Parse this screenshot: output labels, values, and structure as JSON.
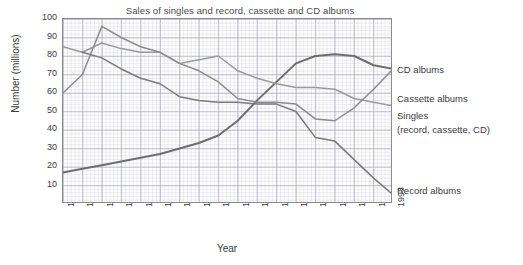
{
  "chart": {
    "title": "Sales of singles and record, cassette and CD albums",
    "xlabel": "Year",
    "ylabel": "Number (millions)"
  },
  "axis": {
    "y_ticks": [
      "100",
      "90",
      "80",
      "70",
      "60",
      "50",
      "40",
      "30",
      "20",
      "10"
    ],
    "x_ticks": [
      "1976",
      "1977",
      "1978",
      "1979",
      "1980",
      "1981",
      "1982",
      "1983",
      "1984",
      "1985",
      "1986",
      "1987",
      "1988",
      "1989",
      "1990",
      "1991",
      "1992",
      "1993"
    ]
  },
  "annotations": {
    "cd": "CD albums",
    "cassette": "Cassette albums",
    "singles": "Singles",
    "singles_sub": "(record, cassette, CD)",
    "record": "Record albums"
  },
  "chart_data": {
    "type": "line",
    "title": "Sales of singles and record, cassette and CD albums",
    "xlabel": "Year",
    "ylabel": "Number (millions)",
    "xlim": [
      1976,
      1993
    ],
    "ylim": [
      0,
      100
    ],
    "ytick_step": 10,
    "grid": true,
    "legend_position": "right-of-axes (inline series labels)",
    "categories": [
      1976,
      1977,
      1978,
      1979,
      1980,
      1981,
      1982,
      1983,
      1984,
      1985,
      1986,
      1987,
      1988,
      1989,
      1990,
      1991,
      1992,
      1993
    ],
    "series": [
      {
        "name": "CD albums",
        "color": "#6e6e6e",
        "x": [
          1976,
          1977,
          1978,
          1979,
          1980,
          1981,
          1982,
          1983,
          1984,
          1985,
          1986,
          1987,
          1988,
          1989,
          1990,
          1991,
          1992,
          1993
        ],
        "values": [
          17,
          19,
          21,
          23,
          25,
          27,
          30,
          33,
          37,
          45,
          56,
          66,
          76,
          80,
          81,
          80,
          75,
          73
        ]
      },
      {
        "name": "Cassette albums",
        "color": "#9a9a9a",
        "x": [
          1976,
          1977,
          1978,
          1979,
          1980,
          1981,
          1982,
          1983,
          1984,
          1985,
          1986,
          1987,
          1988,
          1989,
          1990,
          1991,
          1992,
          1993
        ],
        "values": [
          85,
          82,
          87,
          84,
          82,
          82,
          76,
          78,
          80,
          72,
          68,
          65,
          63,
          63,
          62,
          57,
          55,
          53
        ]
      },
      {
        "name": "Singles (record, cassette, CD)",
        "color": "#8c8c8c",
        "x": [
          1976,
          1977,
          1978,
          1979,
          1980,
          1981,
          1982,
          1983,
          1984,
          1985,
          1986,
          1987,
          1988,
          1989,
          1990,
          1991,
          1992,
          1993
        ],
        "values": [
          60,
          70,
          96,
          90,
          85,
          82,
          76,
          72,
          66,
          57,
          55,
          55,
          54,
          46,
          45,
          52,
          62,
          73
        ]
      },
      {
        "name": "Record albums",
        "color": "#7a7a7a",
        "x": [
          1977,
          1978,
          1979,
          1980,
          1981,
          1982,
          1983,
          1984,
          1985,
          1986,
          1987,
          1988,
          1989,
          1990,
          1991,
          1992,
          1993
        ],
        "values": [
          82,
          79,
          73,
          68,
          65,
          58,
          56,
          55,
          55,
          54,
          54,
          50,
          36,
          34,
          24,
          14,
          5
        ]
      }
    ]
  }
}
